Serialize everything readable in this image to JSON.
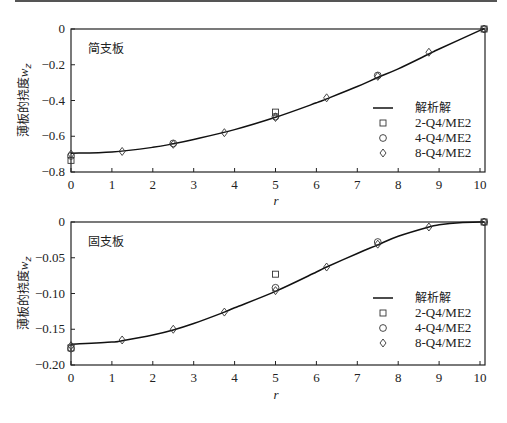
{
  "chart_data": [
    {
      "type": "line",
      "title": "简支板",
      "xlabel": "r",
      "ylabel": "薄板的挠度w_z",
      "xlim": [
        0,
        10.1
      ],
      "ylim": [
        -0.8,
        0
      ],
      "xticks": [
        "0",
        "1",
        "2",
        "3",
        "4",
        "5",
        "6",
        "7",
        "8",
        "9",
        "10"
      ],
      "yticks": [
        "0",
        "-0.2",
        "-0.4",
        "-0.6",
        "-0.8"
      ],
      "grid": false,
      "legend_position": "lower right",
      "legend": [
        "解析解",
        "2-Q4/ME2",
        "4-Q4/ME2",
        "8-Q4/ME2"
      ],
      "series": [
        {
          "name": "解析解",
          "style": "line",
          "x": [
            0,
            1,
            2,
            2.5,
            3,
            4,
            5,
            6,
            6.25,
            7,
            7.5,
            8,
            8.75,
            9,
            10,
            10.1
          ],
          "y": [
            -0.695,
            -0.688,
            -0.662,
            -0.642,
            -0.618,
            -0.563,
            -0.494,
            -0.413,
            -0.391,
            -0.322,
            -0.271,
            -0.223,
            -0.14,
            -0.112,
            -0.008,
            0
          ]
        },
        {
          "name": "2-Q4/ME2",
          "style": "square",
          "x": [
            0,
            5,
            10.1
          ],
          "y": [
            -0.735,
            -0.465,
            0
          ]
        },
        {
          "name": "4-Q4/ME2",
          "style": "circle",
          "x": [
            0,
            2.5,
            5,
            7.5,
            10.1
          ],
          "y": [
            -0.71,
            -0.64,
            -0.49,
            -0.26,
            0
          ]
        },
        {
          "name": "8-Q4/ME2",
          "style": "diamond",
          "x": [
            0,
            1.25,
            2.5,
            3.75,
            5,
            6.25,
            7.5,
            8.75,
            10.1
          ],
          "y": [
            -0.7,
            -0.685,
            -0.645,
            -0.58,
            -0.495,
            -0.385,
            -0.265,
            -0.13,
            0
          ]
        }
      ]
    },
    {
      "type": "line",
      "title": "固支板",
      "xlabel": "r",
      "ylabel": "薄板的挠度w_z",
      "xlim": [
        0,
        10.1
      ],
      "ylim": [
        -0.2,
        0
      ],
      "xticks": [
        "0",
        "1",
        "2",
        "3",
        "4",
        "5",
        "6",
        "7",
        "8",
        "9",
        "10"
      ],
      "yticks": [
        "0",
        "-0.05",
        "-0.10",
        "-0.15",
        "-0.20"
      ],
      "grid": false,
      "legend_position": "lower right",
      "legend": [
        "解析解",
        "2-Q4/ME2",
        "4-Q4/ME2",
        "8-Q4/ME2"
      ],
      "series": [
        {
          "name": "解析解",
          "style": "line",
          "x": [
            0,
            1,
            1.25,
            2,
            2.5,
            3,
            3.75,
            4,
            5,
            6,
            6.25,
            7,
            7.5,
            8,
            8.75,
            9,
            9.5,
            10.1
          ],
          "y": [
            -0.171,
            -0.168,
            -0.166,
            -0.158,
            -0.151,
            -0.142,
            -0.126,
            -0.12,
            -0.097,
            -0.07,
            -0.063,
            -0.044,
            -0.032,
            -0.02,
            -0.007,
            -0.004,
            -0.001,
            0
          ]
        },
        {
          "name": "2-Q4/ME2",
          "style": "square",
          "x": [
            0,
            5,
            10.1
          ],
          "y": [
            -0.176,
            -0.073,
            0
          ]
        },
        {
          "name": "4-Q4/ME2",
          "style": "circle",
          "x": [
            0,
            5,
            7.5,
            10.1
          ],
          "y": [
            -0.177,
            -0.092,
            -0.028,
            0
          ]
        },
        {
          "name": "8-Q4/ME2",
          "style": "diamond",
          "x": [
            0,
            1.25,
            2.5,
            3.75,
            5,
            6.25,
            7.5,
            8.75,
            10.1
          ],
          "y": [
            -0.173,
            -0.165,
            -0.15,
            -0.126,
            -0.096,
            -0.063,
            -0.031,
            -0.007,
            0
          ]
        }
      ]
    }
  ]
}
